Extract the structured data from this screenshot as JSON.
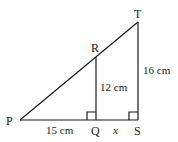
{
  "diagram": {
    "type": "similar-triangles",
    "points": {
      "P": {
        "label": "P",
        "x": 20,
        "y": 120
      },
      "Q": {
        "label": "Q",
        "x": 96,
        "y": 120
      },
      "S": {
        "label": "S",
        "x": 138,
        "y": 120
      },
      "R": {
        "label": "R",
        "x": 96,
        "y": 57
      },
      "T": {
        "label": "T",
        "x": 138,
        "y": 22
      }
    },
    "measurements": {
      "PQ": "15 cm",
      "QS": "x",
      "QR": "12 cm",
      "ST": "16 cm"
    },
    "right_angles": [
      "Q",
      "S"
    ],
    "line_color": "#1a1a1a"
  }
}
